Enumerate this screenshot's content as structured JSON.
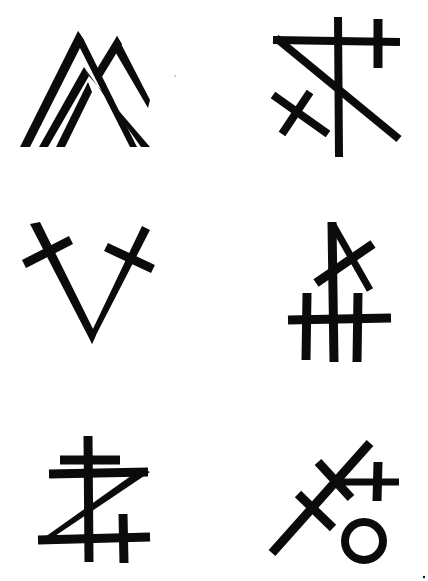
{
  "page": {
    "background": "#ffffff",
    "ink_color": "#0b0b0b",
    "layout": "3 rows x 2 columns of symbols"
  },
  "symbols": [
    {
      "position": "row-1-left",
      "description": "three nested mountain peaks / chevrons",
      "name": "triple-peak-sigil"
    },
    {
      "position": "row-1-right",
      "description": "triangle with crossing vertical, cross and saltire",
      "name": "triangle-cross-sigil"
    },
    {
      "position": "row-2-left",
      "description": "V shape with crossed arm tips",
      "name": "v-cross-sigil"
    },
    {
      "position": "row-2-right",
      "description": "triple vertical bars with crossbar and saltire top",
      "name": "triple-bar-cross-sigil"
    },
    {
      "position": "row-3-left",
      "description": "Z shape with double-barred cross and small cross",
      "name": "z-cross-sigil"
    },
    {
      "position": "row-3-right",
      "description": "diagonal staff with two crossbars, small cross and circle",
      "name": "staff-circle-sigil"
    }
  ]
}
